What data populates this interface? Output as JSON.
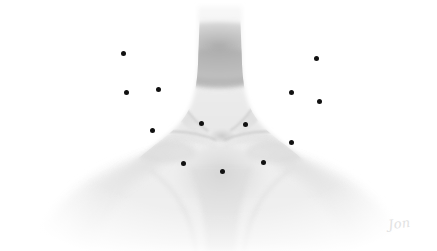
{
  "image": {
    "title": "Anterior neck and upper chest anatomical illustration",
    "subject": "neck-clavicle-sternum region",
    "rendering": "grayscale pencil / airbrush shading",
    "background_color": "#ffffff",
    "skin_light": "#f4f4f4",
    "skin_mid": "#e2e2e2",
    "shadow_dark": "#b4b4b4",
    "marker_color": "#111111",
    "marker_count": 13,
    "signature_text": "Jon",
    "signature_color": "#e2e2e2"
  },
  "markers": [
    {
      "id": "M1",
      "label": "point-1",
      "x": 123,
      "y": 53,
      "side": "left",
      "region": "upper-neck-left"
    },
    {
      "id": "M2",
      "label": "point-2",
      "x": 316,
      "y": 58,
      "side": "right",
      "region": "upper-neck-right"
    },
    {
      "id": "M3",
      "label": "point-3",
      "x": 126,
      "y": 92,
      "side": "left",
      "region": "mid-neck-left-lateral"
    },
    {
      "id": "M4",
      "label": "point-4",
      "x": 158,
      "y": 89,
      "side": "left",
      "region": "mid-neck-left-medial"
    },
    {
      "id": "M5",
      "label": "point-5",
      "x": 291,
      "y": 92,
      "side": "right",
      "region": "mid-neck-right-medial"
    },
    {
      "id": "M6",
      "label": "point-6",
      "x": 319,
      "y": 101,
      "side": "right",
      "region": "mid-neck-right-lateral"
    },
    {
      "id": "M7",
      "label": "point-7",
      "x": 201,
      "y": 123,
      "side": "center",
      "region": "suprasternal-left"
    },
    {
      "id": "M8",
      "label": "point-8",
      "x": 245,
      "y": 124,
      "side": "center",
      "region": "suprasternal-right"
    },
    {
      "id": "M9",
      "label": "point-9",
      "x": 152,
      "y": 130,
      "side": "left",
      "region": "clavicle-left"
    },
    {
      "id": "M10",
      "label": "point-10",
      "x": 291,
      "y": 142,
      "side": "right",
      "region": "clavicle-right"
    },
    {
      "id": "M11",
      "label": "point-11",
      "x": 183,
      "y": 163,
      "side": "left",
      "region": "upper-chest-left"
    },
    {
      "id": "M12",
      "label": "point-12",
      "x": 263,
      "y": 162,
      "side": "right",
      "region": "upper-chest-right"
    },
    {
      "id": "M13",
      "label": "point-13",
      "x": 222,
      "y": 171,
      "side": "center",
      "region": "sternum-midline"
    }
  ]
}
